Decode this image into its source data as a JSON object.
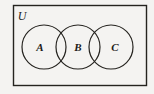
{
  "figure": {
    "type": "venn-diagram",
    "universe": {
      "label": "U",
      "shape": "rectangle"
    },
    "sets": [
      {
        "label": "A",
        "cx": 44,
        "cy": 47,
        "r": 22
      },
      {
        "label": "B",
        "cx": 78,
        "cy": 47,
        "r": 22
      },
      {
        "label": "C",
        "cx": 111,
        "cy": 47,
        "r": 22
      }
    ],
    "colors": {
      "background": "#f4f3f1",
      "stroke": "#25231f",
      "text": "#1d1b19"
    }
  }
}
